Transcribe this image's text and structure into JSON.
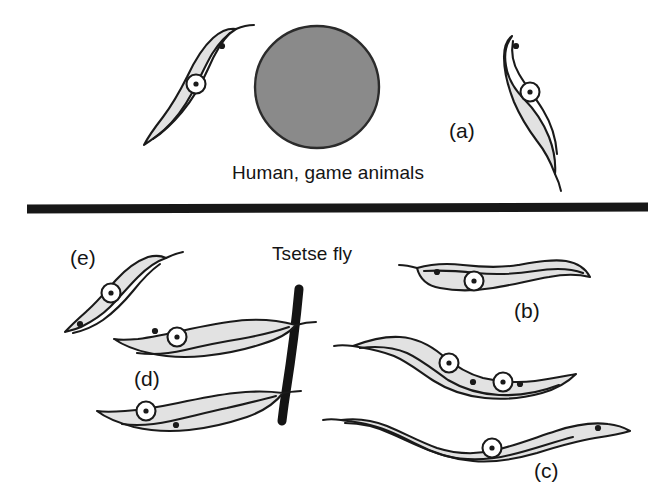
{
  "figure": {
    "domain": "diagram",
    "width": 669,
    "height": 499,
    "background_color": "#ffffff"
  },
  "colors": {
    "ink": "#1a1a1a",
    "cell_fill": "#e2e2e2",
    "host_cell_fill": "#8a8a8a",
    "host_cell_stroke": "#2b2b2b",
    "divider": "#171717",
    "gut_wall": "#141414",
    "text": "#141414",
    "page_background": "#ffffff"
  },
  "sections": {
    "host": {
      "caption": "Human, game animals",
      "caption_x": 232,
      "caption_y": 162
    },
    "vector": {
      "caption": "Tsetse fly",
      "caption_x": 272,
      "caption_y": 243
    }
  },
  "divider": {
    "name": "host-vector-divider-bar",
    "x1": 27,
    "y1": 209,
    "x2": 648,
    "y2": 207,
    "thickness": 9,
    "color": "#171717"
  },
  "host_cell": {
    "name": "host-blood-cell",
    "cx": 317,
    "cy": 87,
    "rx": 62,
    "ry": 61,
    "fill": "#8a8a8a"
  },
  "gut_wall": {
    "name": "tsetse-gut-wall",
    "thickness": 9,
    "color": "#141414",
    "path": "M 299 289 C 296 322 291 360 286 392 C 284 404 283 413 282 421"
  },
  "panel_labels": [
    {
      "key": "a",
      "text": "(a)",
      "x": 449,
      "y": 119
    },
    {
      "key": "b",
      "text": "(b)",
      "x": 514,
      "y": 299
    },
    {
      "key": "c",
      "text": "(c)",
      "x": 534,
      "y": 459
    },
    {
      "key": "d",
      "text": "(d)",
      "x": 134,
      "y": 367
    },
    {
      "key": "e",
      "text": "(e)",
      "x": 70,
      "y": 246
    }
  ],
  "trypanosomes": [
    {
      "id": "host-left-slender",
      "name": "trypanosome-host-left",
      "stage": "slender bloodstream trypomastigote",
      "location": "vertebrate host, left of blood cell",
      "nuclei": 1,
      "nucleus_points": [
        [
          196,
          84
        ]
      ],
      "kinetoplast_points": [
        [
          222,
          46
        ]
      ],
      "body_path": "M 236 29 C 228 34 219 43 212 54 C 205 66 199 80 192 93 C 184 108 174 121 164 130 C 156 137 150 141 144 145 C 149 135 156 126 163 117 C 172 105 180 91 187 77 C 194 62 203 47 213 38 C 221 31 229 28 236 29 Z",
      "membrane_path": "M 230 33 C 221 42 214 55 208 69 C 201 85 192 100 182 112 C 172 124 162 133 153 139",
      "flagellum_path": "M 236 29 C 243 26 249 25 254 25"
    },
    {
      "id": "host-right-slender",
      "name": "trypanosome-host-right",
      "stage": "slender bloodstream trypomastigote",
      "location": "vertebrate host, right of blood cell",
      "nuclei": 1,
      "nucleus_points": [
        [
          530,
          92
        ]
      ],
      "kinetoplast_points": [
        [
          516,
          46
        ]
      ],
      "body_path": "M 512 36 C 506 44 504 55 506 66 C 508 79 515 90 524 99 C 534 109 543 122 549 137 C 554 150 556 162 555 174 C 551 163 545 151 537 141 C 528 129 520 116 514 102 C 508 87 504 71 504 57 C 504 47 507 40 512 36 Z",
      "membrane_path": "M 513 41 C 511 52 513 64 519 74 C 526 86 535 97 543 110 C 551 123 556 139 557 154",
      "flagellum_path": "M 555 174 C 558 180 560 186 561 191"
    },
    {
      "id": "vector-e-diagonal",
      "name": "trypanosome-stage-e",
      "stage": "procyclic trypomastigote",
      "location": "tsetse fly, upper left",
      "label": "(e)",
      "nuclei": 1,
      "nucleus_points": [
        [
          111,
          293
        ]
      ],
      "kinetoplast_points": [
        [
          80,
          324
        ]
      ],
      "body_path": "M 166 258 C 157 261 147 268 138 277 C 128 287 119 298 110 307 C 101 316 91 322 81 327 C 74 330 69 331 65 332 C 71 325 79 318 88 310 C 98 301 107 290 116 280 C 126 269 137 261 148 257 C 156 255 162 256 166 258 Z",
      "membrane_path": "M 160 264 C 150 271 141 281 133 291 C 124 302 114 312 103 320 C 93 327 82 331 73 333",
      "flagellum_path": "M 166 258 C 172 255 178 253 183 252"
    },
    {
      "id": "vector-b-horizontal",
      "name": "trypanosome-stage-b",
      "stage": "procyclic trypomastigote",
      "location": "tsetse fly, upper right",
      "label": "(b)",
      "nuclei": 1,
      "nucleus_points": [
        [
          474,
          281
        ]
      ],
      "kinetoplast_points": [
        [
          437,
          272
        ]
      ],
      "body_path": "M 417 268 C 431 264 447 263 463 265 C 481 267 500 268 518 265 C 536 262 553 259 566 261 C 578 263 586 269 590 277 C 578 274 564 274 549 277 C 531 280 512 285 493 288 C 474 291 455 291 440 288 C 428 286 420 280 417 268 Z",
      "membrane_path": "M 424 271 C 440 270 458 271 476 273 C 496 275 516 274 535 271 C 553 268 570 268 583 273",
      "flagellum_path": "M 417 268 C 410 266 404 265 399 265"
    },
    {
      "id": "vector-dividing-binucleate",
      "name": "trypanosome-dividing-form",
      "stage": "dividing epimastigote (two nuclei)",
      "location": "tsetse fly, middle right",
      "nuclei": 2,
      "nucleus_points": [
        [
          449,
          363
        ],
        [
          503,
          382
        ]
      ],
      "kinetoplast_points": [
        [
          473,
          382
        ],
        [
          520,
          384
        ]
      ],
      "body_path": "M 353 346 C 369 340 385 336 400 337 C 416 338 430 345 442 355 C 455 366 468 374 483 378 C 500 382 518 383 535 381 C 551 379 565 376 576 374 C 568 382 556 389 542 393 C 524 398 504 400 485 398 C 466 396 448 390 434 381 C 420 372 408 362 394 356 C 379 350 365 348 353 346 Z",
      "membrane_path": "M 360 348 C 376 346 393 347 407 353 C 422 360 435 371 448 380 C 463 389 480 394 499 395 C 520 396 541 392 559 385",
      "flagellum_path": "M 353 346 C 345 345 339 345 334 346"
    },
    {
      "id": "vector-c-long-wavy",
      "name": "trypanosome-stage-c",
      "stage": "elongated metacyclic / migrating form",
      "location": "tsetse fly, lower right",
      "label": "(c)",
      "nuclei": 1,
      "nucleus_points": [
        [
          492,
          448
        ]
      ],
      "kinetoplast_points": [
        [
          598,
          428
        ]
      ],
      "body_path": "M 341 420 C 356 418 372 420 387 426 C 404 433 420 442 437 448 C 456 454 476 455 496 450 C 517 445 537 437 556 431 C 574 425 592 422 608 424 C 618 425 625 428 630 431 C 620 434 608 436 595 438 C 576 441 556 447 537 453 C 516 459 494 463 473 461 C 451 459 431 452 414 443 C 397 434 381 427 366 424 C 356 422 347 421 341 420 Z",
      "membrane_path": "M 345 423 C 361 423 377 427 392 434 C 410 442 427 451 446 456 C 467 461 489 460 510 455 C 532 450 553 442 573 437",
      "flagellum_path": "M 341 420 C 334 419 328 419 323 420"
    },
    {
      "id": "vector-d-upper-attached",
      "name": "trypanosome-stage-d-upper",
      "stage": "epimastigote attached to gut wall",
      "location": "tsetse fly, attached to gut wall, upper",
      "label": "(d)",
      "nuclei": 1,
      "nucleus_points": [
        [
          177,
          337
        ]
      ],
      "kinetoplast_points": [
        [
          155,
          331
        ]
      ],
      "body_path": "M 296 325 C 281 321 264 319 247 320 C 228 321 209 325 190 329 C 172 333 154 337 138 339 C 127 340 119 340 114 339 C 123 345 135 350 149 353 C 166 357 185 358 204 356 C 224 354 244 350 262 344 C 279 339 290 332 296 325 Z",
      "membrane_path": "M 289 327 C 274 332 257 336 240 339 C 221 342 202 346 185 350 C 168 354 151 355 137 353",
      "flagellum_path": "M 296 325 C 303 323 310 322 316 322"
    },
    {
      "id": "vector-d-lower-attached",
      "name": "trypanosome-stage-d-lower",
      "stage": "epimastigote attached to gut wall",
      "location": "tsetse fly, attached to gut wall, lower",
      "label": "(d)",
      "nuclei": 1,
      "nucleus_points": [
        [
          146,
          411
        ]
      ],
      "kinetoplast_points": [
        [
          176,
          425
        ]
      ],
      "body_path": "M 283 393 C 268 391 252 391 235 393 C 216 395 197 399 178 403 C 159 407 141 410 125 411 C 112 412 103 412 97 411 C 106 418 119 423 134 427 C 151 431 170 432 189 430 C 209 428 229 423 247 417 C 264 411 276 402 283 393 Z",
      "membrane_path": "M 276 396 C 261 400 244 404 227 408 C 208 412 189 417 171 421 C 153 425 136 426 122 424",
      "flagellum_path": "M 283 393 C 290 392 296 391 301 391"
    }
  ]
}
